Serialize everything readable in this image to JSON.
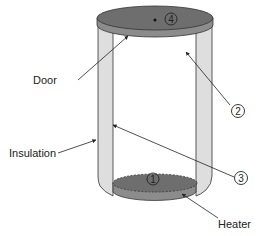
{
  "diagram": {
    "labels": {
      "door": "Door",
      "insulation": "Insulation",
      "heater": "Heater"
    },
    "markers": {
      "m1": "1",
      "m2": "2",
      "m3": "3",
      "m4": "4"
    },
    "colors": {
      "insulation_fill": "#dedede",
      "lid_top": "#6e6e6e",
      "lid_side": "#8c8c8c",
      "heater_top": "#6e6e6e",
      "heater_side": "#8c8c8c",
      "stroke": "#333333"
    }
  }
}
